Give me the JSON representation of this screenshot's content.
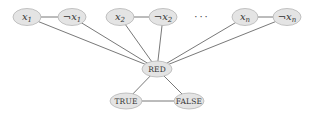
{
  "diagram": {
    "type": "graph",
    "colors": {
      "node_fill": "#e4e4e4",
      "node_stroke": "#b5b5b5",
      "edge": "#555555",
      "text": "#333333"
    },
    "nodes": [
      {
        "id": "x1",
        "label_var": "x",
        "label_sub": "1",
        "negated": false,
        "cx": 27,
        "cy": 17,
        "rx": 14,
        "ry": 8.5
      },
      {
        "id": "nx1",
        "label_var": "x",
        "label_sub": "1",
        "negated": true,
        "cx": 72,
        "cy": 17,
        "rx": 14,
        "ry": 8.5
      },
      {
        "id": "x2",
        "label_var": "x",
        "label_sub": "2",
        "negated": false,
        "cx": 120,
        "cy": 17,
        "rx": 14,
        "ry": 8.5
      },
      {
        "id": "nx2",
        "label_var": "x",
        "label_sub": "2",
        "negated": true,
        "cx": 163,
        "cy": 17,
        "rx": 14,
        "ry": 8.5
      },
      {
        "id": "xn",
        "label_var": "x",
        "label_sub": "n",
        "negated": false,
        "cx": 245,
        "cy": 17,
        "rx": 13,
        "ry": 8.5
      },
      {
        "id": "nxn",
        "label_var": "x",
        "label_sub": "n",
        "negated": true,
        "cx": 287,
        "cy": 17,
        "rx": 14,
        "ry": 8.5
      },
      {
        "id": "red",
        "label": "RED",
        "cx": 157,
        "cy": 69,
        "rx": 15,
        "ry": 8
      },
      {
        "id": "true",
        "label": "TRUE",
        "cx": 126,
        "cy": 101,
        "rx": 16,
        "ry": 8
      },
      {
        "id": "false",
        "label": "FALSE",
        "cx": 189,
        "cy": 101,
        "rx": 15,
        "ry": 8
      }
    ],
    "ellipsis": {
      "text": "···",
      "x": 202,
      "y": 20
    },
    "negation_symbol": "¬",
    "edges": [
      [
        "x1",
        "nx1"
      ],
      [
        "x2",
        "nx2"
      ],
      [
        "xn",
        "nxn"
      ],
      [
        "x1",
        "red"
      ],
      [
        "nx1",
        "red"
      ],
      [
        "x2",
        "red"
      ],
      [
        "nx2",
        "red"
      ],
      [
        "xn",
        "red"
      ],
      [
        "nxn",
        "red"
      ],
      [
        "red",
        "true"
      ],
      [
        "red",
        "false"
      ],
      [
        "true",
        "false"
      ]
    ]
  }
}
